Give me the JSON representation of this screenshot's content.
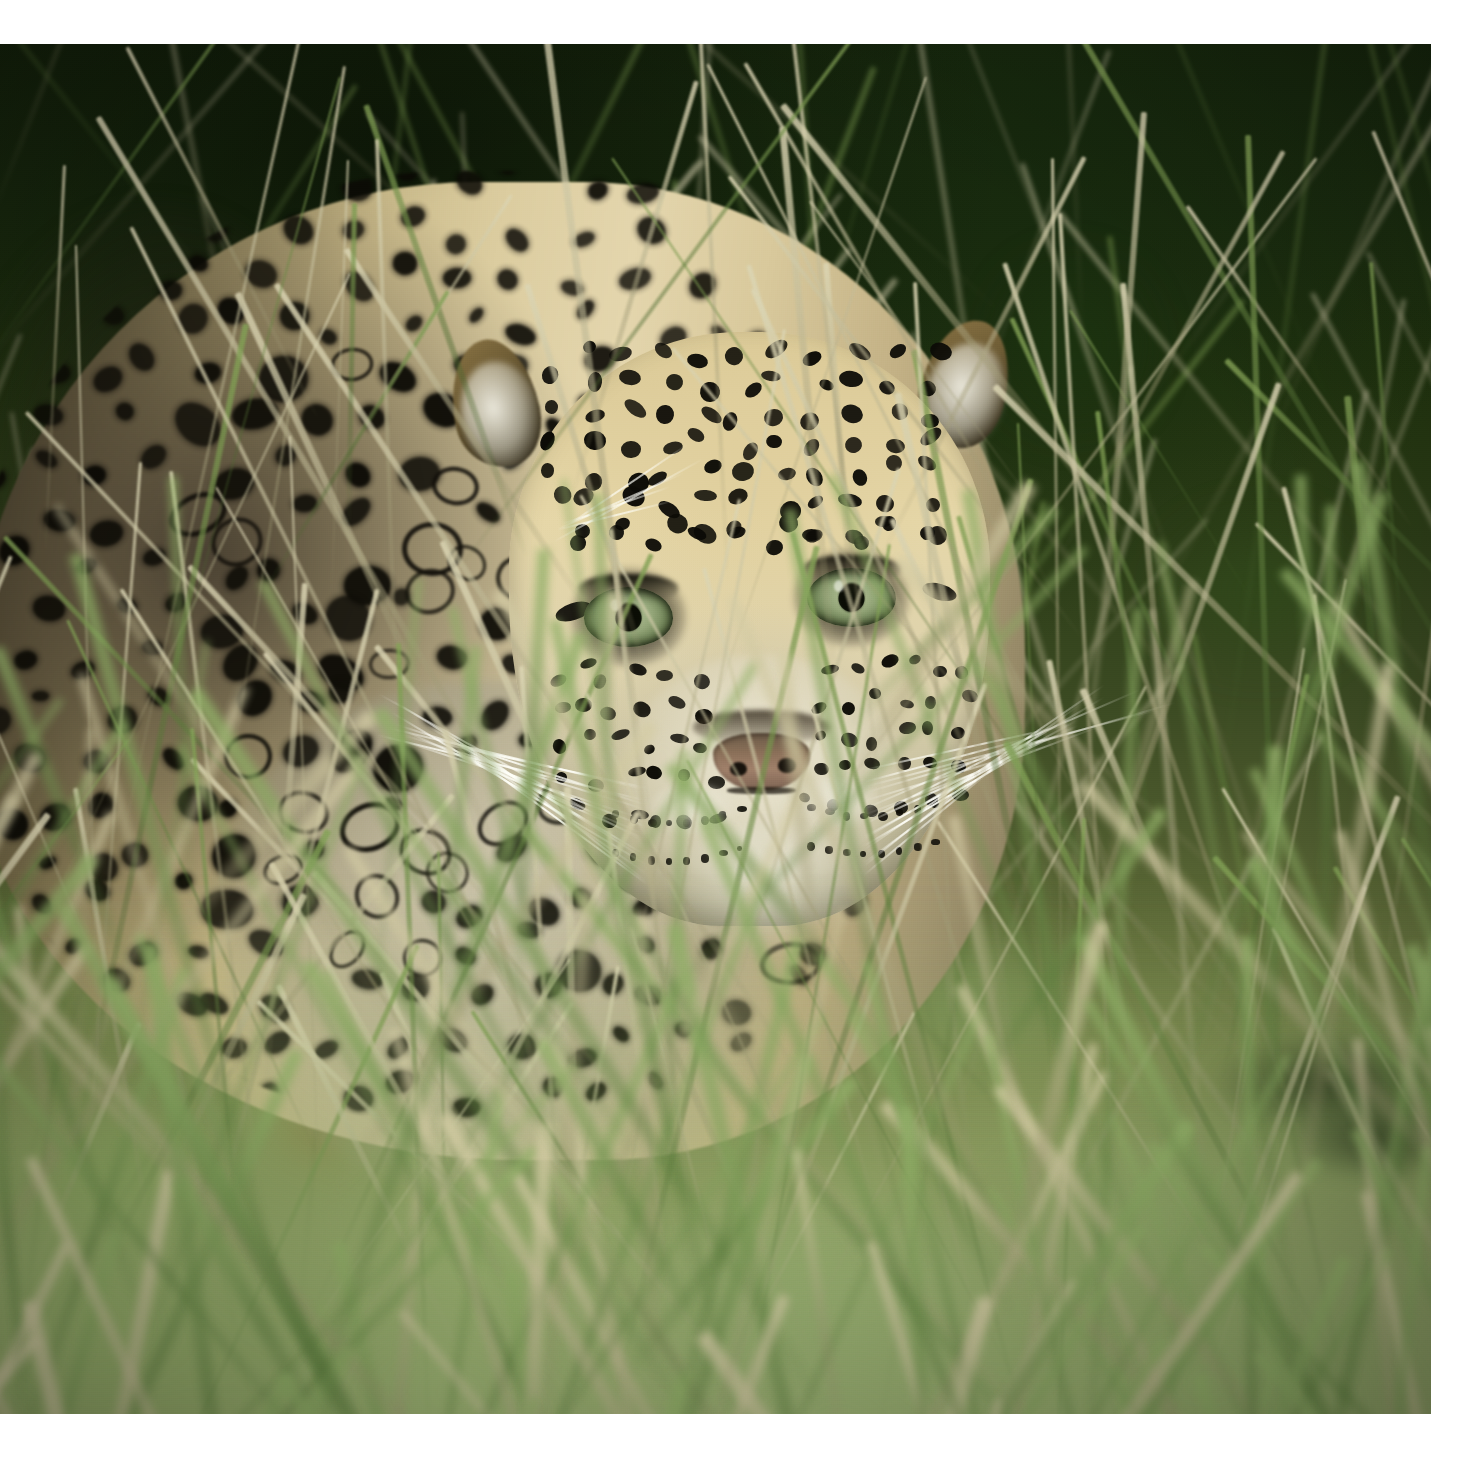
{
  "document": {
    "kind": "photograph",
    "orientation": "landscape",
    "page_background": "#ffffff"
  },
  "photo": {
    "title": "Leopard crouching in tall grass",
    "subject": "leopard",
    "scene": "African savanna grassland",
    "frame": {
      "left": 0,
      "top": 44,
      "width": 1431,
      "height": 1370
    },
    "palette": {
      "background_dark_green": "#16250c",
      "background_mid_green": "#3b4a22",
      "foreground_pale_green": "#8e9864",
      "coat_base": "#e4d6ad",
      "coat_shadow": "#7d7256",
      "spot_black": "#0b0a05",
      "eye_green": "#93a578",
      "eye_pupil": "#0a0c04",
      "nose_pink_brown": "#a0806a",
      "whisker_white": "#fffff8",
      "grass_straw": "#c9c09a",
      "grass_green": "#7f9a4e",
      "rust_clump": "#a0603a",
      "log_dark": "#18230e"
    },
    "elements": {
      "leopard_body": "spotted torso in left half, crouched low",
      "leopard_head": "facing camera, lowered, right of centre",
      "eyes": "two pale green-amber eyes with dark round pupils",
      "ears": "both ears rounded with long white fur tufts",
      "nose": "broad pinkish-brown nose with dark bridge",
      "whiskers": "long white whiskers fanning left and right",
      "rosettes": "dense black rosettes and solid spots across coat",
      "grass_background": "dark green blurred bush, diagonal pale stems",
      "grass_foreground": "out-of-focus green and straw grass veil",
      "log": "dark log fragment at lower right"
    }
  },
  "margins": {
    "top_label": "top-white-margin",
    "right_label": "right-white-margin",
    "bottom_label": "bottom-white-margin"
  }
}
